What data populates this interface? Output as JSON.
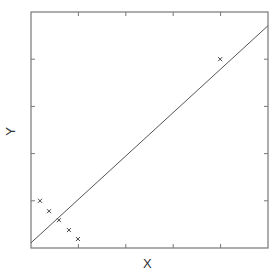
{
  "chart_data": {
    "type": "scatter",
    "title": "",
    "xlabel": "X",
    "ylabel": "Y",
    "xlim": [
      0,
      5
    ],
    "ylim": [
      0,
      5
    ],
    "x_ticks": [
      1,
      2,
      3,
      4
    ],
    "y_ticks": [
      1,
      2,
      3,
      4
    ],
    "tick_labels_shown": false,
    "grid": false,
    "legend": null,
    "series": [
      {
        "name": "points",
        "marker": "x",
        "x": [
          0.19,
          0.38,
          0.59,
          0.8,
          0.99,
          3.99
        ],
        "y": [
          1.0,
          0.78,
          0.59,
          0.38,
          0.19,
          4.0
        ]
      },
      {
        "name": "fit-line",
        "type": "line",
        "x": [
          0,
          5
        ],
        "y": [
          0.11,
          4.71
        ]
      }
    ],
    "colors": {
      "axes": "#777777",
      "line": "#555555",
      "marker": "#444444"
    }
  }
}
